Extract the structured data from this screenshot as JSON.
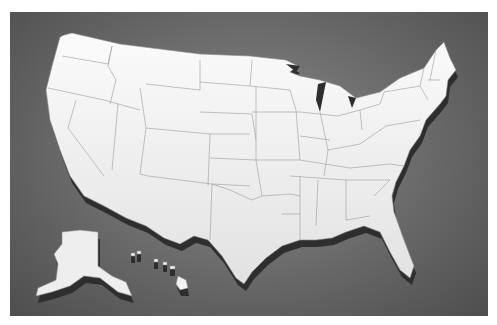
{
  "image": {
    "subject": "3D extruded map of the United States",
    "style": "white raised states on dark grey gradient background",
    "regions_shown": [
      "Contiguous United States",
      "Alaska",
      "Hawaii"
    ],
    "labels": []
  },
  "colors": {
    "land": "#f3f3f3",
    "state_border": "#8a8a8a",
    "extrusion": "#2e2e2e",
    "background_center": "#8a8a8a",
    "background_edge": "#4e4e4e",
    "margin": "#ffffff"
  }
}
